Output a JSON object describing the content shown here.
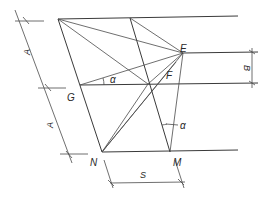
{
  "diagram": {
    "type": "geometric-construction",
    "labels": {
      "E": "E",
      "F": "F",
      "G": "G",
      "N": "N",
      "M": "M",
      "alpha_top": "α",
      "alpha_bottom": "α"
    },
    "dimensions": {
      "left_upper": "A",
      "left_lower": "A",
      "right": "B",
      "bottom": "S"
    },
    "colors": {
      "line": "#3a3a3a",
      "background": "#ffffff"
    }
  }
}
